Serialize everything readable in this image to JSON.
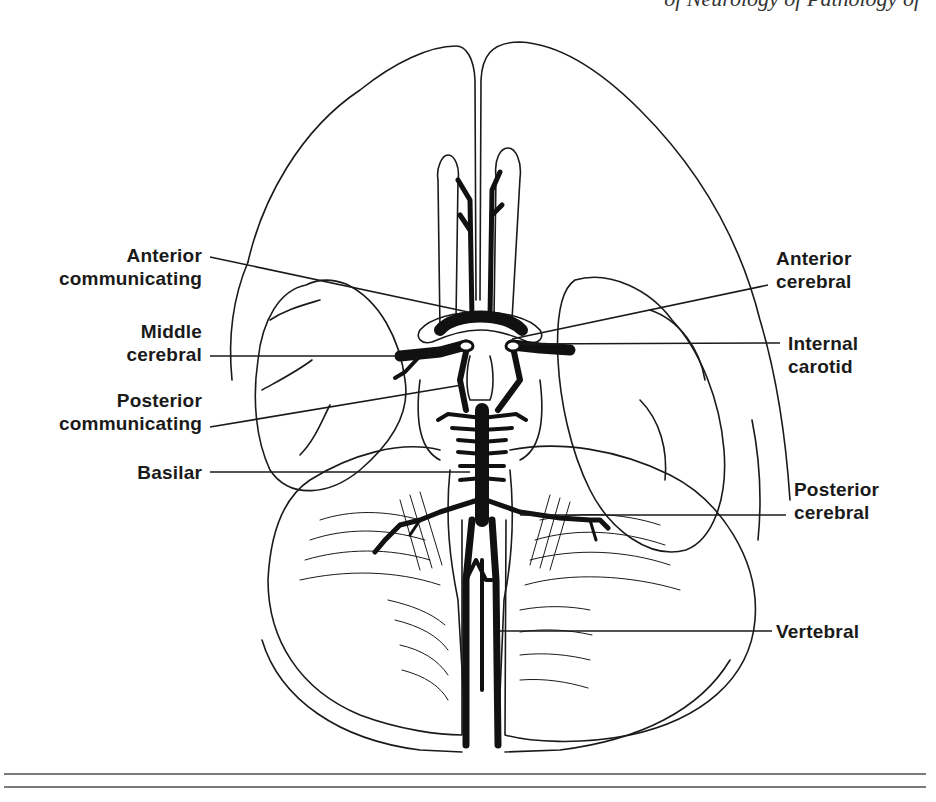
{
  "header": {
    "running_title": "of Neurology of Pathology of"
  },
  "figure": {
    "stroke_color": "#1a1a1a",
    "vessel_fill": "#111111",
    "background": "#ffffff",
    "labels": {
      "anterior_communicating": {
        "line1": "Anterior",
        "line2": "communicating"
      },
      "middle_cerebral": {
        "line1": "Middle",
        "line2": "cerebral"
      },
      "posterior_communicating": {
        "line1": "Posterior",
        "line2": "communicating"
      },
      "basilar": {
        "line1": "Basilar"
      },
      "anterior_cerebral": {
        "line1": "Anterior",
        "line2": "cerebral"
      },
      "internal_carotid": {
        "line1": "Internal",
        "line2": "carotid"
      },
      "posterior_cerebral": {
        "line1": "Posterior",
        "line2": "cerebral"
      },
      "vertebral": {
        "line1": "Vertebral"
      }
    }
  },
  "rules": {
    "count": 2,
    "color": "#7a7a7a"
  }
}
